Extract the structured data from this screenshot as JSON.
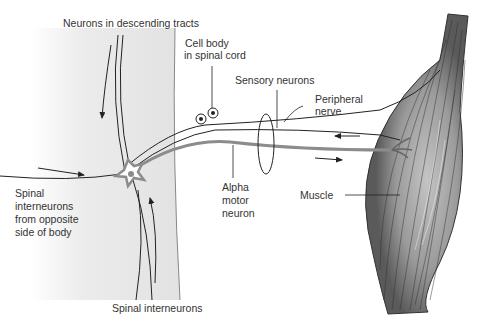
{
  "diagram": {
    "type": "neuroanatomy",
    "labels": {
      "descending": "Neurons in descending tracts",
      "cell_body_1": "Cell body",
      "cell_body_2": "in spinal cord",
      "sensory": "Sensory neurons",
      "peripheral_1": "Peripheral",
      "peripheral_2": "nerve",
      "opposite_1": "Spinal",
      "opposite_2": "interneurons",
      "opposite_3": "from opposite",
      "opposite_4": "side of body",
      "alpha_1": "Alpha",
      "alpha_2": "motor",
      "alpha_3": "neuron",
      "muscle": "Muscle",
      "interneurons": "Spinal interneurons"
    },
    "colors": {
      "spinal_cord": "#e8e8e8",
      "muscle_dark": "#5a5a5a",
      "muscle_light": "#b8b8b8",
      "motor_neuron": "#8c8c8c",
      "line": "#222222",
      "text": "#333333"
    }
  }
}
